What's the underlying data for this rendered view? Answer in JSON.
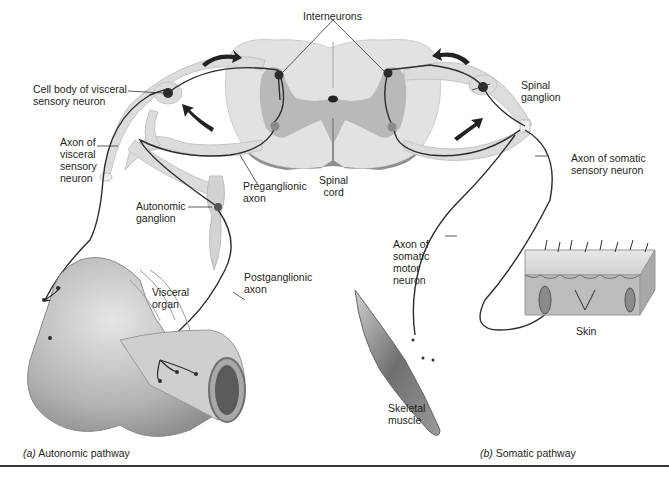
{
  "figure": {
    "type": "anatomical-diagram",
    "labels": {
      "interneurons": "Interneurons",
      "cell_body_visceral": "Cell body of visceral\nsensory neuron",
      "axon_visceral": "Axon of\nvisceral\nsensory\nneuron",
      "autonomic_ganglion": "Autonomic\nganglion",
      "preganglionic_axon": "Preganglionic\naxon",
      "spinal_cord": "Spinal\ncord",
      "spinal_ganglion": "Spinal\nganglion",
      "axon_somatic_sensory": "Axon of somatic\nsensory neuron",
      "postganglionic_axon": "Postganglionic\naxon",
      "visceral_organ": "Visceral\norgan",
      "axon_somatic_motor": "Axon of\nsomatic\nmotor\nneuron",
      "skin": "Skin",
      "skeletal_muscle": "Skeletal\nmuscle"
    },
    "captions": {
      "a_letter": "(a)",
      "a_text": " Autonomic pathway",
      "b_letter": "(b)",
      "b_text": " Somatic pathway"
    },
    "colors": {
      "cord_white_matter": "#e2e2e2",
      "cord_gray_matter": "#b9b9b9",
      "cord_shadow": "#8f8f8f",
      "nerve": "#dcdcdc",
      "neuron_body": "#3b3b3b",
      "interneuron_body": "#8a8a8a",
      "intestine": "#b8b8b8",
      "muscle": "#7a7a7a",
      "skin": "#bdbdbd"
    }
  }
}
